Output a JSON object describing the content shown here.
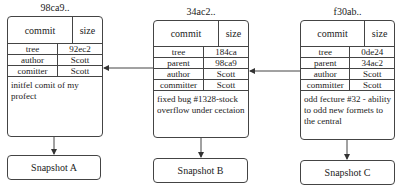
{
  "commits": [
    {
      "id": "98ca9..",
      "header": {
        "type": "commit",
        "size": "size"
      },
      "rows": [
        {
          "key": "tree",
          "value": "92ec2"
        },
        {
          "key": "author",
          "value": "Scott"
        },
        {
          "key": "comitter",
          "value": "Scott"
        }
      ],
      "message": "initfel comit of my profect",
      "snapshot": "Snapshot A"
    },
    {
      "id": "34ac2..",
      "header": {
        "type": "commit",
        "size": "size"
      },
      "rows": [
        {
          "key": "tree",
          "value": "184ca"
        },
        {
          "key": "parent",
          "value": "98ca9"
        },
        {
          "key": "author",
          "value": "Scott"
        },
        {
          "key": "committer",
          "value": "Scott"
        }
      ],
      "message": "fixed bug #1328-stock overflow under cectaion",
      "snapshot": "Snapshot B"
    },
    {
      "id": "f30ab..",
      "header": {
        "type": "commit",
        "size": "size"
      },
      "rows": [
        {
          "key": "tree",
          "value": "0de24"
        },
        {
          "key": "parent",
          "value": "34ac2"
        },
        {
          "key": "author",
          "value": "Scott"
        },
        {
          "key": "committer",
          "value": "Scott"
        }
      ],
      "message": "odd fecture #32 - ability to odd new formets to the central",
      "snapshot": "Snapshot C"
    }
  ],
  "colors": {
    "stroke": "#444444",
    "text": "#222222",
    "background": "#ffffff"
  }
}
